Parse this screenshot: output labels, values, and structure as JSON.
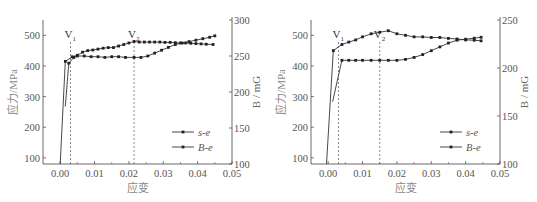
{
  "chart_data": [
    {
      "type": "line",
      "title": "",
      "xlabel": "应变",
      "ylabel": "应力/MPa",
      "y2label": "B / mG",
      "xlim": [
        -0.005,
        0.05
      ],
      "ylim": [
        80,
        550
      ],
      "y2lim": [
        100,
        300
      ],
      "xticks": [
        "0.00",
        "0.01",
        "0.02",
        "0.03",
        "0.04",
        "0.05"
      ],
      "yticks": [
        "100",
        "200",
        "300",
        "400",
        "500"
      ],
      "y2ticks": [
        "100",
        "150",
        "200",
        "250",
        "300"
      ],
      "annotations": [
        {
          "label": "V",
          "sub": "1",
          "x": 0.003
        },
        {
          "label": "V",
          "sub": "2",
          "x": 0.0215
        }
      ],
      "legend": {
        "position": "lower right",
        "entries": [
          "s-e",
          "B-e"
        ]
      },
      "grid": false,
      "series": [
        {
          "name": "s-e",
          "axis": "left",
          "x": [
            0.0,
            0.0015,
            0.0035,
            0.005,
            0.0065,
            0.008,
            0.0095,
            0.011,
            0.0125,
            0.014,
            0.0155,
            0.017,
            0.0185,
            0.02,
            0.0215,
            0.023,
            0.0245,
            0.026,
            0.0275,
            0.029,
            0.0305,
            0.032,
            0.0335,
            0.035,
            0.0365,
            0.038,
            0.0395,
            0.041,
            0.0425,
            0.0445
          ],
          "y": [
            80,
            415,
            430,
            435,
            445,
            450,
            452,
            455,
            458,
            460,
            460,
            465,
            470,
            475,
            480,
            478,
            478,
            478,
            478,
            478,
            477,
            477,
            476,
            475,
            475,
            474,
            473,
            472,
            471,
            470
          ]
        },
        {
          "name": "B-e",
          "axis": "right",
          "x": [
            0.0015,
            0.0025,
            0.004,
            0.005,
            0.007,
            0.009,
            0.011,
            0.013,
            0.015,
            0.017,
            0.019,
            0.0215,
            0.0235,
            0.0255,
            0.0275,
            0.0295,
            0.0315,
            0.0335,
            0.0355,
            0.0375,
            0.0395,
            0.0415,
            0.0435,
            0.045
          ],
          "y": [
            180,
            240,
            248,
            250,
            250,
            249,
            249,
            248,
            249,
            249,
            248,
            248,
            248,
            250,
            254,
            258,
            262,
            266,
            268,
            270,
            272,
            274,
            276,
            278
          ]
        }
      ]
    },
    {
      "type": "line",
      "title": "",
      "xlabel": "应变",
      "ylabel": "应力/MPa",
      "y2label": "B / mG",
      "xlim": [
        -0.005,
        0.05
      ],
      "ylim": [
        80,
        550
      ],
      "y2lim": [
        100,
        250
      ],
      "xticks": [
        "0.00",
        "0.01",
        "0.02",
        "0.03",
        "0.04",
        "0.05"
      ],
      "yticks": [
        "100",
        "200",
        "300",
        "400",
        "500"
      ],
      "y2ticks": [
        "100",
        "150",
        "200",
        "250"
      ],
      "annotations": [
        {
          "label": "V",
          "sub": "1",
          "x": 0.003
        },
        {
          "label": "V",
          "sub": "2",
          "x": 0.015
        }
      ],
      "legend": {
        "position": "lower right",
        "entries": [
          "s-e",
          "B-e"
        ]
      },
      "grid": false,
      "series": [
        {
          "name": "s-e",
          "axis": "left",
          "x": [
            -0.0005,
            0.0015,
            0.004,
            0.006,
            0.008,
            0.01,
            0.0125,
            0.015,
            0.0175,
            0.02,
            0.0225,
            0.025,
            0.0275,
            0.03,
            0.0325,
            0.035,
            0.0375,
            0.04,
            0.0425,
            0.0445
          ],
          "y": [
            80,
            450,
            470,
            478,
            485,
            495,
            505,
            510,
            515,
            505,
            500,
            495,
            495,
            493,
            493,
            490,
            488,
            485,
            484,
            482
          ]
        },
        {
          "name": "B-e",
          "axis": "right",
          "x": [
            0.0013,
            0.004,
            0.006,
            0.008,
            0.01,
            0.0125,
            0.015,
            0.0175,
            0.02,
            0.0225,
            0.025,
            0.0275,
            0.03,
            0.0325,
            0.035,
            0.0375,
            0.04,
            0.0425,
            0.0445
          ],
          "y": [
            165,
            208,
            208,
            208,
            208,
            208,
            208,
            208,
            208,
            209,
            211,
            214,
            218,
            222,
            226,
            229,
            230,
            231,
            232
          ]
        }
      ]
    }
  ]
}
